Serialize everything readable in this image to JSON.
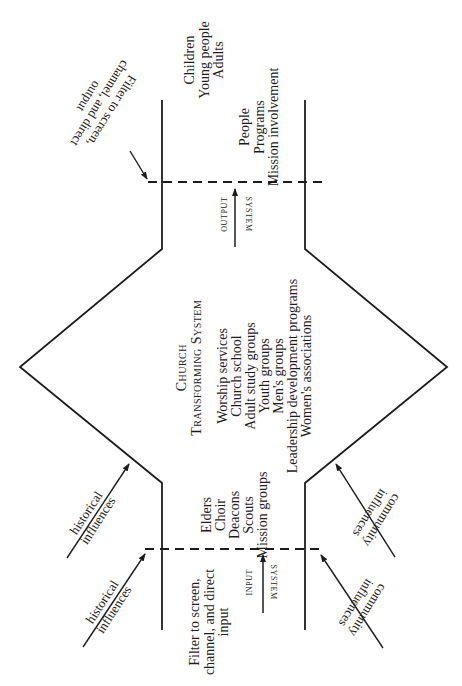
{
  "diagram": {
    "title_line1": "Church",
    "title_line2": "Transforming System",
    "transforming_items": [
      "Worship services",
      "Church school",
      "Adult study groups",
      "Youth groups",
      "Men's groups",
      "Leadership development programs",
      "Women's associations"
    ],
    "input_items": [
      "Elders",
      "Choir",
      "Deacons",
      "Scouts",
      "Mission groups"
    ],
    "output_items": [
      "People",
      "Programs",
      "Mission involvement"
    ],
    "output_recipients": [
      "Children",
      "Young people",
      "Adults"
    ],
    "input_filter_label": [
      "Filter to screen,",
      "channel, and direct",
      "input"
    ],
    "output_filter_label": [
      "Filter to screen,",
      "channel, and direct",
      "output"
    ],
    "input_system": {
      "word1": "INPUT",
      "word2": "SYSTEM"
    },
    "output_system": {
      "word1": "OUTPUT",
      "word2": "SYSTEM"
    },
    "left_influences": [
      {
        "line1": "historical",
        "line2": "influences"
      },
      {
        "line1": "historical",
        "line2": "influences"
      }
    ],
    "right_influences": [
      {
        "line1": "community",
        "line2": "influences"
      },
      {
        "line1": "community",
        "line2": "influences"
      }
    ],
    "colors": {
      "ink": "#1c1c1c",
      "paper": "#ffffff"
    }
  }
}
